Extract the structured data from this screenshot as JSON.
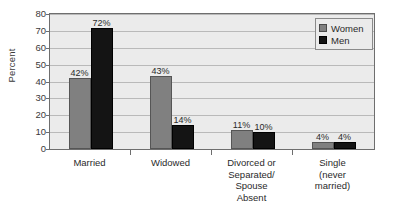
{
  "chart_data": {
    "type": "bar",
    "title": "",
    "subtitle": "",
    "xlabel": "",
    "ylabel": "Percent",
    "ylim": [
      0,
      80
    ],
    "ytick_step": 10,
    "yticks": [
      0,
      10,
      20,
      30,
      40,
      50,
      60,
      70,
      80
    ],
    "ytick_labels": [
      "0",
      "10",
      "20",
      "30",
      "40",
      "50",
      "60",
      "70",
      "80"
    ],
    "grid": true,
    "grid_axis": "y",
    "legend_position": "top-right",
    "categories": [
      "Married",
      "Widowed",
      "Divorced or Separated/ Spouse Absent",
      "Single (never married)"
    ],
    "category_label_lines": [
      [
        "Married"
      ],
      [
        "Widowed"
      ],
      [
        "Divorced or",
        "Separated/",
        "Spouse",
        "Absent"
      ],
      [
        "Single",
        "(never",
        "married)"
      ]
    ],
    "series": [
      {
        "name": "Women",
        "color": "#808080",
        "values": [
          42,
          43,
          11,
          4
        ],
        "data_labels": [
          "42%",
          "43%",
          "11%",
          "4%"
        ]
      },
      {
        "name": "Men",
        "color": "#141414",
        "values": [
          72,
          14,
          10,
          4
        ],
        "data_labels": [
          "72%",
          "14%",
          "10%",
          "4%"
        ]
      }
    ]
  },
  "legend": {
    "items": [
      {
        "label": "Women",
        "color": "#808080"
      },
      {
        "label": "Men",
        "color": "#141414"
      }
    ]
  },
  "colors": {
    "women_bar": "#808080",
    "men_bar": "#141414",
    "plot_background": "#ebebeb",
    "gridline": "#b9b9b9",
    "axis": "#6e6e6e",
    "page_background": "#ffffff"
  }
}
